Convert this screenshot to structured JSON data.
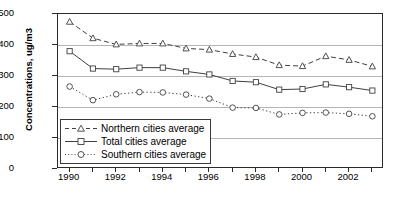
{
  "chart_data": {
    "type": "line",
    "title": "",
    "xlabel": "",
    "ylabel": "Concentrations, ug/m3",
    "x": [
      1990,
      1991,
      1992,
      1993,
      1994,
      1995,
      1996,
      1997,
      1998,
      1999,
      2000,
      2001,
      2002,
      2003
    ],
    "xtick_labels": [
      "1990",
      "1992",
      "1994",
      "1996",
      "1998",
      "2000",
      "2002"
    ],
    "xtick_values": [
      1990,
      1992,
      1994,
      1996,
      1998,
      2000,
      2002
    ],
    "xlim": [
      1989.5,
      2003.5
    ],
    "ytick_labels": [
      "0",
      "100",
      "200",
      "300",
      "400",
      "500"
    ],
    "ytick_values": [
      0,
      100,
      200,
      300,
      400,
      500
    ],
    "ylim": [
      0,
      500
    ],
    "grid": "horizontal",
    "legend_position": "lower-left-inside",
    "series": [
      {
        "name": "Northern cities average",
        "marker": "triangle",
        "linestyle": "dashed",
        "color": "#404040",
        "values": [
          475,
          422,
          402,
          405,
          405,
          389,
          385,
          371,
          361,
          335,
          332,
          364,
          352,
          331
        ]
      },
      {
        "name": "Total cities average",
        "marker": "square",
        "linestyle": "solid",
        "color": "#404040",
        "values": [
          380,
          324,
          322,
          327,
          327,
          315,
          305,
          284,
          280,
          256,
          258,
          273,
          264,
          253
        ]
      },
      {
        "name": "Southern cities average",
        "marker": "circle",
        "linestyle": "dotted",
        "color": "#404040",
        "values": [
          266,
          222,
          241,
          248,
          247,
          240,
          227,
          198,
          197,
          176,
          181,
          182,
          178,
          170
        ]
      }
    ]
  },
  "legend": {
    "items": [
      {
        "label": "Northern cities average"
      },
      {
        "label": "Total cities average"
      },
      {
        "label": "Southern cities average"
      }
    ]
  },
  "colors": {
    "axis": "#2b2b2b",
    "grid": "#b5b5b5",
    "series": "#404040",
    "background": "#ffffff"
  }
}
